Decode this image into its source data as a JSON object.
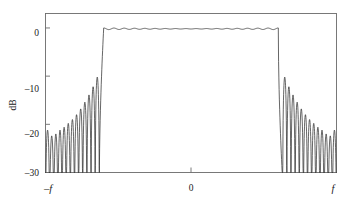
{
  "chart_data": {
    "type": "line",
    "title": "",
    "subtitle": "",
    "xlabel": "",
    "ylabel": "dB",
    "xlim": [
      -1,
      1
    ],
    "ylim": [
      -30,
      3
    ],
    "grid": false,
    "legend": null,
    "x_ticks": [
      {
        "value": -1,
        "label": "–f",
        "italic": true
      },
      {
        "value": 0,
        "label": "0",
        "italic": false
      },
      {
        "value": 1,
        "label": "f",
        "italic": true
      }
    ],
    "y_ticks": [
      {
        "value": 0,
        "label": "0"
      },
      {
        "value": -10,
        "label": "–10"
      },
      {
        "value": -20,
        "label": "–20"
      },
      {
        "value": -30,
        "label": "–30"
      }
    ],
    "passband": {
      "left_edge": -0.6,
      "right_edge": 0.6,
      "ripple_db": 0.35,
      "nominal_db": 0.0
    },
    "stopband": {
      "left_range": [
        -1.0,
        -0.63
      ],
      "right_range": [
        0.63,
        1.0
      ],
      "peak_db_near_transition": -10.2,
      "peak_db_far": -21.0,
      "null_floor_db": -32,
      "lobe_count_each_side": 13
    },
    "series": [
      {
        "name": "magnitude response",
        "color": "#2a2a2a",
        "peaks_left_db": [
          -21.2,
          -22.4,
          -22.0,
          -21.2,
          -20.6,
          -19.8,
          -19.0,
          -18.0,
          -16.8,
          -15.4,
          -13.9,
          -12.2,
          -10.2
        ],
        "peaks_right_db": [
          -10.2,
          -12.2,
          -13.9,
          -15.4,
          -16.8,
          -18.0,
          -19.0,
          -19.8,
          -20.6,
          -21.2,
          -22.0,
          -22.4,
          -21.2
        ]
      }
    ]
  },
  "figure": {
    "axis_label": "dB",
    "x_left_label": "–f",
    "x_center_label": "0",
    "x_right_label": "f",
    "y_label_0": "0",
    "y_label_10": "–10",
    "y_label_20": "–20",
    "y_label_30": "–30",
    "frame_color": "#6b6b6b",
    "curve_color": "#2a2a2a",
    "background_color": "#ffffff"
  }
}
